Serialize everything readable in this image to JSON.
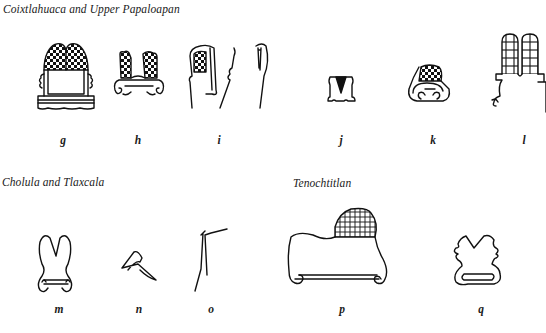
{
  "sections": [
    {
      "heading": "Coixtlahuaca and Upper Papaloapan",
      "glyphs": [
        {
          "label": "g",
          "description": "two-lobed checkered hill atop platform with wavy base"
        },
        {
          "label": "h",
          "description": "two checkered lobes on scroll base"
        },
        {
          "label": "i",
          "description": "tall hill fragment with checkered inset and split peak"
        },
        {
          "label": "j",
          "description": "small hill with dark wedge"
        },
        {
          "label": "k",
          "description": "checkered hill over curled scroll base"
        },
        {
          "label": "l",
          "description": "two tall gridded lobes with curl"
        }
      ]
    },
    {
      "heading": "Cholula and Tlaxcala",
      "glyphs": [
        {
          "label": "m",
          "description": "split-top hill outline with scroll feet"
        },
        {
          "label": "n",
          "description": "small triangular hill sketch"
        },
        {
          "label": "o",
          "description": "stepped line fragment"
        }
      ]
    },
    {
      "heading": "Tenochtitlan",
      "glyphs": [
        {
          "label": "p",
          "description": "broad hill with gridded peak and scroll feet"
        },
        {
          "label": "q",
          "description": "two-peaked hill with base bar"
        }
      ]
    }
  ]
}
